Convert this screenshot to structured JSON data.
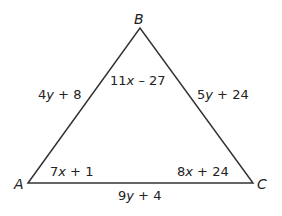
{
  "diagram": {
    "type": "triangle",
    "vertices": {
      "A": {
        "label": "A"
      },
      "B": {
        "label": "B"
      },
      "C": {
        "label": "C"
      }
    },
    "sides": {
      "AB": {
        "coef": "4",
        "var": "y",
        "rest": " + 8"
      },
      "BC": {
        "coef": "5",
        "var": "y",
        "rest": " + 24"
      },
      "AC": {
        "coef": "9",
        "var": "y",
        "rest": " + 4"
      }
    },
    "angles": {
      "B": {
        "coef": "11",
        "var": "x",
        "rest": " – 27"
      },
      "A": {
        "coef": "7",
        "var": "x",
        "rest": " + 1"
      },
      "C": {
        "coef": "8",
        "var": "x",
        "rest": " + 24"
      }
    },
    "line_color": "#333333"
  }
}
